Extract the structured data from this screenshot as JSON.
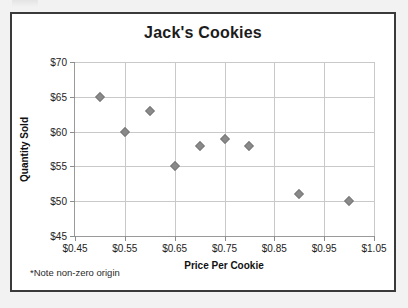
{
  "card": {
    "footnote": "*Note non-zero origin"
  },
  "chart_data": {
    "type": "scatter",
    "title": "Jack's Cookies",
    "xlabel": "Price Per Cookie",
    "ylabel": "Quantity Sold",
    "xlim": [
      0.45,
      1.05
    ],
    "ylim": [
      45,
      70
    ],
    "xticks": [
      0.45,
      0.55,
      0.65,
      0.75,
      0.85,
      0.95,
      1.05
    ],
    "yticks": [
      45,
      50,
      55,
      60,
      65,
      70
    ],
    "xtick_labels": [
      "$0.45",
      "$0.55",
      "$0.65",
      "$0.75",
      "$0.85",
      "$0.95",
      "$1.05"
    ],
    "ytick_labels": [
      "$45",
      "$50",
      "$55",
      "$60",
      "$65",
      "$70"
    ],
    "grid": true,
    "legend": "none",
    "marker_color": "#8a8a8a",
    "marker_shape": "diamond",
    "gridline_color": "#c9c9c9",
    "points": [
      {
        "x": 0.5,
        "y": 65
      },
      {
        "x": 0.55,
        "y": 60
      },
      {
        "x": 0.6,
        "y": 63
      },
      {
        "x": 0.65,
        "y": 55
      },
      {
        "x": 0.7,
        "y": 58
      },
      {
        "x": 0.75,
        "y": 59
      },
      {
        "x": 0.8,
        "y": 58
      },
      {
        "x": 0.9,
        "y": 51
      },
      {
        "x": 1.0,
        "y": 50
      }
    ]
  }
}
